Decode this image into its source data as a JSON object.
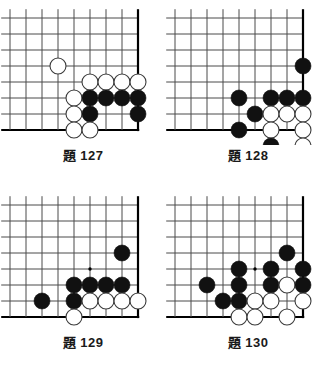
{
  "page": {
    "background_color": "#ffffff",
    "width": 331,
    "height": 373
  },
  "style": {
    "grid_line_color": "#4a4a4a",
    "edge_line_color": "#000000",
    "black_stone_color": "#111111",
    "white_stone_fill": "#ffffff",
    "white_stone_stroke": "#3a3a3a",
    "star_point_color": "#000000",
    "cell_size": 16,
    "stone_radius": 8
  },
  "problems": [
    {
      "id": "problem-127",
      "caption_ti": "題",
      "caption_number": "127",
      "position": {
        "left": 0,
        "top": 0
      },
      "board": {
        "cols": 9,
        "rows": 8,
        "origin_x": 10,
        "origin_y": 18,
        "edge_right_col": 8,
        "edge_bottom_row": 7,
        "star_points": []
      },
      "stones": [
        {
          "color": "white",
          "col": 3,
          "row": 3
        },
        {
          "color": "white",
          "col": 5,
          "row": 4
        },
        {
          "color": "white",
          "col": 6,
          "row": 4
        },
        {
          "color": "white",
          "col": 7,
          "row": 4
        },
        {
          "color": "white",
          "col": 8,
          "row": 4
        },
        {
          "color": "white",
          "col": 4,
          "row": 5
        },
        {
          "color": "black",
          "col": 5,
          "row": 5
        },
        {
          "color": "black",
          "col": 6,
          "row": 5
        },
        {
          "color": "black",
          "col": 7,
          "row": 5
        },
        {
          "color": "black",
          "col": 8,
          "row": 5
        },
        {
          "color": "white",
          "col": 4,
          "row": 6
        },
        {
          "color": "black",
          "col": 5,
          "row": 6
        },
        {
          "color": "black",
          "col": 8,
          "row": 6
        },
        {
          "color": "white",
          "col": 4,
          "row": 7
        },
        {
          "color": "white",
          "col": 5,
          "row": 7
        }
      ]
    },
    {
      "id": "problem-128",
      "caption_ti": "題",
      "caption_number": "128",
      "position": {
        "left": 165,
        "top": 0
      },
      "board": {
        "cols": 9,
        "rows": 8,
        "origin_x": 10,
        "origin_y": 18,
        "edge_right_col": 8,
        "edge_bottom_row": 7,
        "star_points": []
      },
      "stones": [
        {
          "color": "black",
          "col": 8,
          "row": 3
        },
        {
          "color": "black",
          "col": 4,
          "row": 5
        },
        {
          "color": "black",
          "col": 6,
          "row": 5
        },
        {
          "color": "black",
          "col": 7,
          "row": 5
        },
        {
          "color": "black",
          "col": 8,
          "row": 5
        },
        {
          "color": "black",
          "col": 5,
          "row": 6
        },
        {
          "color": "white",
          "col": 6,
          "row": 6
        },
        {
          "color": "white",
          "col": 7,
          "row": 6
        },
        {
          "color": "white",
          "col": 8,
          "row": 6
        },
        {
          "color": "black",
          "col": 4,
          "row": 7
        },
        {
          "color": "white",
          "col": 6,
          "row": 7
        },
        {
          "color": "white",
          "col": 8,
          "row": 7
        },
        {
          "color": "black",
          "col": 6,
          "row": 8
        },
        {
          "color": "white",
          "col": 8,
          "row": 8
        }
      ]
    },
    {
      "id": "problem-129",
      "caption_ti": "題",
      "caption_number": "129",
      "position": {
        "left": 0,
        "top": 187
      },
      "board": {
        "cols": 9,
        "rows": 8,
        "origin_x": 10,
        "origin_y": 18,
        "edge_right_col": 8,
        "edge_bottom_row": 7,
        "star_points": [
          {
            "col": 5,
            "row": 4
          }
        ]
      },
      "stones": [
        {
          "color": "black",
          "col": 7,
          "row": 3
        },
        {
          "color": "black",
          "col": 4,
          "row": 5
        },
        {
          "color": "black",
          "col": 5,
          "row": 5
        },
        {
          "color": "black",
          "col": 6,
          "row": 5
        },
        {
          "color": "black",
          "col": 7,
          "row": 5
        },
        {
          "color": "black",
          "col": 2,
          "row": 6
        },
        {
          "color": "black",
          "col": 4,
          "row": 6
        },
        {
          "color": "white",
          "col": 5,
          "row": 6
        },
        {
          "color": "white",
          "col": 6,
          "row": 6
        },
        {
          "color": "white",
          "col": 7,
          "row": 6
        },
        {
          "color": "white",
          "col": 8,
          "row": 6
        },
        {
          "color": "white",
          "col": 4,
          "row": 7
        }
      ]
    },
    {
      "id": "problem-130",
      "caption_ti": "題",
      "caption_number": "130",
      "position": {
        "left": 165,
        "top": 187
      },
      "board": {
        "cols": 9,
        "rows": 8,
        "origin_x": 10,
        "origin_y": 18,
        "edge_right_col": 8,
        "edge_bottom_row": 7,
        "star_points": [
          {
            "col": 5,
            "row": 4
          }
        ]
      },
      "stones": [
        {
          "color": "black",
          "col": 7,
          "row": 3
        },
        {
          "color": "black",
          "col": 4,
          "row": 4
        },
        {
          "color": "black",
          "col": 6,
          "row": 4
        },
        {
          "color": "black",
          "col": 8,
          "row": 4
        },
        {
          "color": "black",
          "col": 2,
          "row": 5
        },
        {
          "color": "black",
          "col": 4,
          "row": 5
        },
        {
          "color": "black",
          "col": 6,
          "row": 5
        },
        {
          "color": "white",
          "col": 7,
          "row": 5
        },
        {
          "color": "black",
          "col": 8,
          "row": 5
        },
        {
          "color": "black",
          "col": 3,
          "row": 6
        },
        {
          "color": "black",
          "col": 4,
          "row": 6
        },
        {
          "color": "white",
          "col": 5,
          "row": 6
        },
        {
          "color": "white",
          "col": 6,
          "row": 6
        },
        {
          "color": "white",
          "col": 8,
          "row": 6
        },
        {
          "color": "white",
          "col": 4,
          "row": 7
        },
        {
          "color": "white",
          "col": 5,
          "row": 7
        },
        {
          "color": "white",
          "col": 7,
          "row": 7
        }
      ]
    }
  ]
}
